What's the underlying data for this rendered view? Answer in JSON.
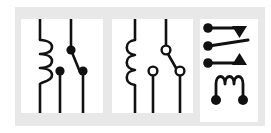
{
  "figure": {
    "backdrop_color": "#e8e8e8",
    "panel_color": "#ffffff",
    "ink_color": "#111111",
    "page_background": "#ffffff",
    "panel_count": 3
  },
  "panels": [
    {
      "id": "panel-1",
      "name": "relay-symbol-filled-terminals",
      "label": "Relay symbol with filled terminal dots",
      "coil": {
        "style": "looped-helix",
        "loop_count": 3,
        "side": "right-of-line",
        "terminal_top": "open-line",
        "terminal_bottom": "open-line"
      },
      "contacts": {
        "terminal_style": "filled",
        "common_terminal": "top",
        "throw_count": 2,
        "armature_direction": "down-right"
      }
    },
    {
      "id": "panel-2",
      "name": "relay-symbol-hollow-terminals",
      "label": "Relay symbol with hollow terminal circles",
      "coil": {
        "style": "semicircle-humps",
        "loop_count": 3,
        "side": "left-of-line",
        "terminal_top": "open-line",
        "terminal_bottom": "open-line"
      },
      "contacts": {
        "terminal_style": "hollow",
        "common_terminal": "top",
        "throw_count": 2,
        "armature_direction": "down-right"
      }
    },
    {
      "id": "panel-3",
      "name": "relay-symbol-horizontal-triangles",
      "label": "Relay symbol with horizontal contacts and triangle markers",
      "contacts": {
        "terminal_style": "filled",
        "terminal_count": 3,
        "terminal_side": "left",
        "marker_shapes": [
          "triangle-down",
          "triangle-up"
        ],
        "armature_direction": "up-right"
      },
      "coil": {
        "style": "arch-loops",
        "loop_count": 3,
        "orientation": "horizontal",
        "terminal_style": "filled",
        "terminal_count": 2,
        "position": "below-contacts"
      }
    }
  ]
}
